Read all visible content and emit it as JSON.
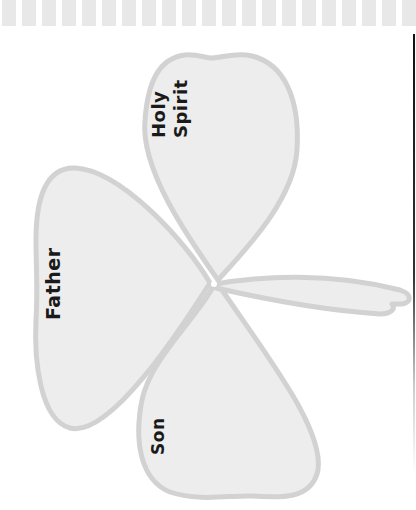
{
  "page": {
    "type": "worksheet"
  },
  "border": {
    "dash_count": 21,
    "dash_color": "#e8e8e8",
    "rule_color": "#111111"
  },
  "shamrock": {
    "fill_color": "#ededed",
    "outline_color": "#d2d2d2",
    "leaves": [
      {
        "id": "holy-spirit",
        "label_line1": "Holy",
        "label_line2": "Spirit"
      },
      {
        "id": "father",
        "label": "Father"
      },
      {
        "id": "son",
        "label": "Son"
      }
    ]
  }
}
